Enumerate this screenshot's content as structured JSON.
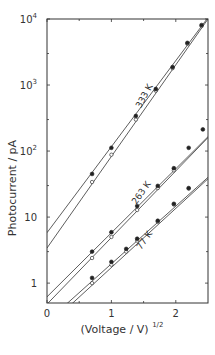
{
  "chart_data": {
    "type": "scatter",
    "title": "",
    "xlabel": "(Voltage / V)^1/2",
    "xlabel_main": "(Voltage / V)",
    "xlabel_sup": "1/2",
    "ylabel": "Photocurrent / pA",
    "xlim": [
      0,
      2.5
    ],
    "ylim": [
      0.5,
      10000
    ],
    "yscale": "log",
    "grid": false,
    "legend": "inline labels along lines",
    "x_ticks": [
      {
        "value": 0,
        "label": "0"
      },
      {
        "value": 1,
        "label": "1"
      },
      {
        "value": 2,
        "label": "2"
      }
    ],
    "y_ticks": [
      {
        "value": 1,
        "label": "1"
      },
      {
        "value": 10,
        "label": "10"
      },
      {
        "value": 100,
        "label": "10",
        "sup": "2"
      },
      {
        "value": 1000,
        "label": "10",
        "sup": "3"
      },
      {
        "value": 10000,
        "label": "10",
        "sup": "4"
      }
    ],
    "series": [
      {
        "name": "333 K",
        "label": "333 K",
        "filled": {
          "x": [
            0.7,
            1.0,
            1.38,
            1.69,
            1.95,
            2.18,
            2.4
          ],
          "y": [
            45,
            112,
            340,
            870,
            1870,
            4350,
            8100
          ]
        },
        "open": {
          "x": [
            0.7,
            1.0,
            1.38,
            1.69,
            1.95,
            2.18,
            2.4
          ],
          "y": [
            34,
            88,
            300,
            820,
            1800,
            4200,
            7800
          ]
        },
        "fit_lines": [
          {
            "x": [
              0,
              2.5
            ],
            "y": [
              5.8,
              10500
            ]
          },
          {
            "x": [
              0,
              2.5
            ],
            "y": [
              3.4,
              10000
            ]
          }
        ]
      },
      {
        "name": "263 K",
        "label": "263 K",
        "filled": {
          "x": [
            0.7,
            1.0,
            1.4,
            1.72,
            1.97,
            2.2,
            2.42
          ],
          "y": [
            3.0,
            5.9,
            14.7,
            29.7,
            55,
            112,
            213
          ]
        },
        "open": {
          "x": [
            0.7,
            1.0,
            1.4,
            1.72,
            1.97
          ],
          "y": [
            2.4,
            5.0,
            12.8,
            27.5,
            51
          ]
        },
        "fit_lines": [
          {
            "x": [
              0,
              2.5
            ],
            "y": [
              0.62,
              165
            ]
          },
          {
            "x": [
              0,
              2.5
            ],
            "y": [
              0.48,
              160
            ]
          }
        ]
      },
      {
        "name": "77 K",
        "label": "77 K",
        "filled": {
          "x": [
            0.7,
            1.0,
            1.23,
            1.4,
            1.72,
            1.97,
            2.2
          ],
          "y": [
            1.2,
            2.1,
            3.3,
            4.7,
            8.8,
            15.9,
            27.5
          ]
        },
        "open": {
          "x": [
            0.7,
            1.0,
            1.23,
            1.4,
            1.72,
            1.97,
            2.2
          ],
          "y": [
            1.0,
            1.9,
            3.0,
            4.4,
            8.5,
            15.5,
            27
          ]
        },
        "fit_lines": [
          {
            "x": [
              0.3,
              2.5
            ],
            "y": [
              0.48,
              40
            ]
          },
          {
            "x": [
              0.38,
              2.5
            ],
            "y": [
              0.48,
              38
            ]
          }
        ]
      }
    ]
  }
}
